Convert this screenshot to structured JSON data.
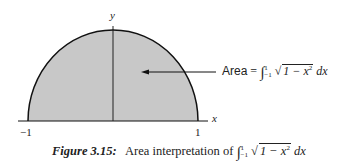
{
  "figure": {
    "axes": {
      "x_label": "x",
      "y_label": "y",
      "ticks": {
        "left": "−1",
        "right": "1"
      }
    },
    "region": {
      "shape": "upper semicircle",
      "equation": "y = sqrt(1 - x^2)",
      "domain": [
        -1,
        1
      ],
      "fill_color": "#c8c8c8",
      "outline_color": "#111111"
    },
    "annotation": {
      "label_word": "Area",
      "equals": "=",
      "integral_sign": "∫",
      "lower_limit": "−1",
      "upper_limit": "1",
      "radical": "√",
      "integrand": "1 − x",
      "exponent": "2",
      "differential": "dx",
      "arrow": "left"
    },
    "caption": {
      "number": "Figure 3.15:",
      "text": "Area interpretation of",
      "integral_sign": "∫",
      "lower_limit": "−1",
      "upper_limit": "1",
      "radical": "√",
      "integrand": "1 − x",
      "exponent": "2",
      "differential": "dx"
    }
  }
}
